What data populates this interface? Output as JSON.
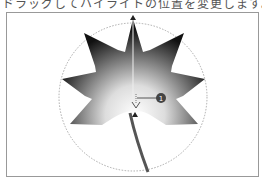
{
  "caption": "ドラッグしてハイライトの位置を変更します。",
  "callouts": [
    {
      "number": "1"
    }
  ],
  "colors": {
    "leaf_dark": "#1a1a1a",
    "leaf_light": "#ffffff",
    "frame": "#999999",
    "guide_circle": "#aaaaaa",
    "callout": "#444444"
  }
}
